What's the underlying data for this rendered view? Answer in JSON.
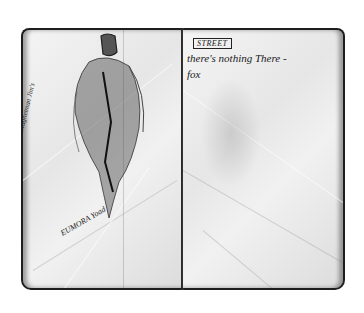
{
  "image": {
    "description": "Open sketchbook with pencil figure drawing on left page and handwritten notes on right page",
    "background_color": "#ffffff",
    "page_color": "#ececec",
    "border_color": "#1e1e1e"
  },
  "left_page": {
    "sketch": "pencil-figure-cloaked",
    "caption_vertical": "At Magnetman Jim's",
    "caption_bottom": "EUMORA Yoad"
  },
  "right_page": {
    "label": "STREET",
    "line1": "there's nothing There -",
    "line2": "fox"
  }
}
